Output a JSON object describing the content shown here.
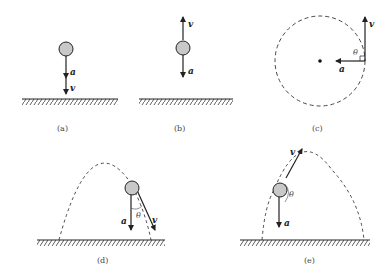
{
  "panels": [
    {
      "id": "a",
      "caption": "(a)",
      "vectors": {
        "v": "v",
        "a": "a"
      }
    },
    {
      "id": "b",
      "caption": "(b)",
      "vectors": {
        "v": "v",
        "a": "a"
      }
    },
    {
      "id": "c",
      "caption": "(c)",
      "vectors": {
        "v": "v",
        "a": "a"
      },
      "angle": "θ"
    },
    {
      "id": "d",
      "caption": "(d)",
      "vectors": {
        "v": "v",
        "a": "a"
      },
      "angle": "θ"
    },
    {
      "id": "e",
      "caption": "(e)",
      "vectors": {
        "v": "v",
        "a": "a"
      },
      "angle": "θ"
    }
  ],
  "colors": {
    "ball": "#c8c8c8",
    "stroke": "#222222"
  }
}
